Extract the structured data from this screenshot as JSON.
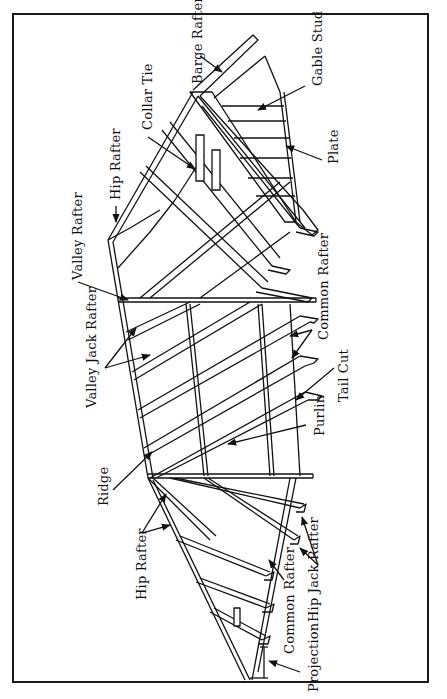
{
  "figure": {
    "type": "roof framing diagram",
    "orientation": "rotated 90 degrees counter-clockwise",
    "line_color": "#111111",
    "background": "#ffffff"
  },
  "labels": {
    "barge_rafter": "Barge Rafter",
    "gable_stud": "Gable Stud",
    "plate": "Plate",
    "collar_tie": "Collar Tie",
    "hip_rafter_top": "Hip Rafter",
    "valley_rafter": "Valley Rafter",
    "valley_jack_rafter": "Valley Jack Rafter",
    "common_rafter_top": "Common Rafter",
    "tail_cut": "Tail Cut",
    "purlin": "Purlin",
    "ridge": "Ridge",
    "hip_rafter_bottom": "Hip Rafter",
    "common_rafter_bottom": "Common Rafter",
    "hip_jack_rafter": "Hip Jack Rafter",
    "projection": "Projection"
  }
}
